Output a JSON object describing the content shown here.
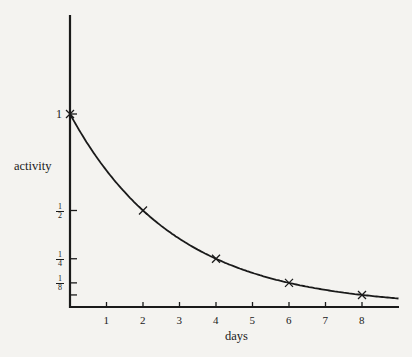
{
  "chart_data": {
    "type": "line",
    "title": "",
    "xlabel": "days",
    "ylabel": "activity",
    "x_ticks": [
      "1",
      "2",
      "3",
      "4",
      "5",
      "6",
      "7",
      "8"
    ],
    "y_ticks": [
      {
        "value": 1,
        "label": "1"
      },
      {
        "value": 0.5,
        "label": "1/2",
        "num": "1",
        "den": "2"
      },
      {
        "value": 0.25,
        "label": "1/4",
        "num": "1",
        "den": "4"
      },
      {
        "value": 0.125,
        "label": "1/8",
        "num": "1",
        "den": "8"
      },
      {
        "value": 0.0625,
        "label": ""
      }
    ],
    "series": [
      {
        "name": "activity",
        "marker": "x",
        "x": [
          0,
          2,
          4,
          6,
          8
        ],
        "values": [
          1,
          0.5,
          0.25,
          0.125,
          0.0625
        ]
      }
    ],
    "curve": "exponential decay, half-life 2 days",
    "xlim": [
      0,
      9
    ],
    "ylim": [
      0,
      1
    ],
    "grid": false,
    "legend": "none"
  }
}
